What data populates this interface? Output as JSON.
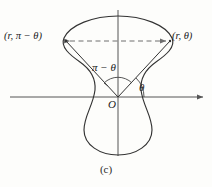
{
  "figure": {
    "caption": "(c)",
    "background_color": "#fdfdfb",
    "stroke_color": "#333333",
    "axis_color": "#555555",
    "dashed_color": "#777777",
    "labels": {
      "point_right": "(r, θ)",
      "point_left": "(r, π − θ)",
      "angle_theta": "θ",
      "angle_supplement": "π − θ",
      "origin": "O"
    },
    "geometry": {
      "origin": {
        "x": 118,
        "y": 97
      },
      "x_axis": {
        "x1": 10,
        "y1": 97,
        "x2": 205,
        "y2": 97,
        "arrow": "right"
      },
      "y_axis": {
        "x1": 118,
        "y1": 10,
        "x2": 118,
        "y2": 156,
        "arrow": "none"
      },
      "point_right": {
        "x": 170,
        "y": 41
      },
      "point_left": {
        "x": 66,
        "y": 41
      },
      "chord": {
        "x1": 66,
        "y1": 41,
        "x2": 170,
        "y2": 41,
        "style": "dashed",
        "arrows": "both"
      },
      "theta_arc_radius": 26,
      "supplement_arc_radius": 20,
      "curve_type": "polar-lobed-closed-curve",
      "symmetry_axis": "vertical"
    }
  }
}
